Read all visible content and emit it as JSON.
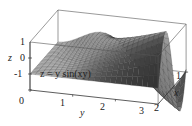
{
  "chart_data": {
    "type": "surface",
    "equation": "z = y sin(xy)",
    "title": "",
    "xlabel": "x",
    "ylabel": "y",
    "zlabel": "z",
    "xlim": [
      0,
      2
    ],
    "ylim": [
      0,
      3
    ],
    "zlim": [
      -1,
      2
    ],
    "x_ticks": [
      "1",
      "2"
    ],
    "y_ticks": [
      "0",
      "1",
      "2",
      "3"
    ],
    "z_ticks": [
      "1",
      "0",
      "-1"
    ],
    "z_tick_values": [
      1,
      0,
      -1
    ],
    "y_tick_values": [
      0,
      1,
      2,
      3
    ],
    "x_tick_values": [
      1,
      2
    ],
    "grid": false,
    "surface_style": "wireframe mesh with gray shading",
    "mesh_resolution": 24,
    "colors": {
      "surface_light": "#d9d9d9",
      "surface_dark": "#1e1e1e",
      "mesh_line": "#333333",
      "box": "#555555"
    }
  }
}
